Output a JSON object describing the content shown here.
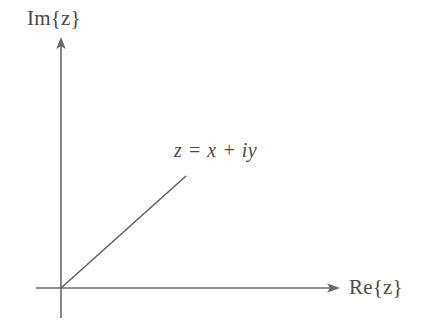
{
  "figure": {
    "background_color": "#ffffff",
    "stroke_color": "#6a6a6a",
    "text_color": "#4a4a4a",
    "width": 425,
    "height": 329
  },
  "axes": {
    "origin": {
      "x": 61,
      "y": 288
    },
    "vertical": {
      "label": "Im{z}",
      "name": "imaginary-axis",
      "from": {
        "x": 61,
        "y": 318
      },
      "to": {
        "x": 61,
        "y": 38
      },
      "arrow": true
    },
    "horizontal": {
      "label": "Re{z}",
      "name": "real-axis",
      "from": {
        "x": 36,
        "y": 288
      },
      "to": {
        "x": 339,
        "y": 288
      },
      "arrow": true
    }
  },
  "ray": {
    "name": "vector-z",
    "label": "z = x + iy",
    "from": {
      "x": 61,
      "y": 288
    },
    "to": {
      "x": 186,
      "y": 176
    },
    "arrow": false
  },
  "labels": {
    "imaginary_axis": "Im{z}",
    "real_axis": "Re{z}",
    "equation": "z = x + iy"
  }
}
